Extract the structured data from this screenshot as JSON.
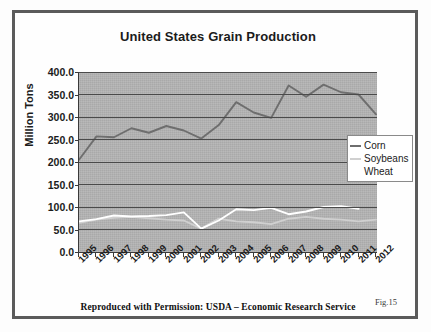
{
  "figure": {
    "title": "United States Grain Production",
    "credit": "Reproduced with Permission: USDA – Economic Research Service",
    "figure_number": "Fig.15"
  },
  "legend": {
    "position": "right-middle",
    "entries": [
      {
        "label": "Corn",
        "color": "#6e6e6e"
      },
      {
        "label": "Soybeans",
        "color": "#d0d0d0"
      },
      {
        "label": "Wheat",
        "color": "#ffffff"
      }
    ]
  },
  "axes": {
    "y_title": "Million Tons",
    "y_ticks": [
      "0.0",
      "50.0",
      "100.0",
      "150.0",
      "200.0",
      "250.0",
      "300.0",
      "350.0",
      "400.0"
    ],
    "x_ticks": [
      "1995",
      "1996",
      "1997",
      "1998",
      "1999",
      "2000",
      "2001",
      "2002",
      "2003",
      "2004",
      "2005",
      "2006",
      "2007",
      "2008",
      "2009",
      "2010",
      "2011",
      "2012"
    ]
  },
  "colors": {
    "plot_background": "#a9a9a9",
    "gridline": "#4a4a4a",
    "frame": "#5b5b5b",
    "text": "#1b1b1b"
  },
  "chart_data": {
    "type": "line",
    "title": "United States Grain Production",
    "xlabel": "",
    "ylabel": "Million Tons",
    "ylim": [
      0,
      400
    ],
    "ytick_step": 50,
    "grid": true,
    "legend_position": "right",
    "categories": [
      "1995",
      "1996",
      "1997",
      "1998",
      "1999",
      "2000",
      "2001",
      "2002",
      "2003",
      "2004",
      "2005",
      "2006",
      "2007",
      "2008",
      "2009",
      "2010",
      "2011",
      "2012"
    ],
    "series": [
      {
        "name": "Corn",
        "color": "#6e6e6e",
        "values": [
          205,
          257,
          255,
          275,
          265,
          280,
          270,
          252,
          282,
          333,
          310,
          298,
          370,
          345,
          372,
          355,
          350,
          306
        ]
      },
      {
        "name": "Soybeans",
        "color": "#d0d0d0",
        "values": [
          65,
          72,
          76,
          78,
          75,
          72,
          70,
          52,
          74,
          68,
          66,
          62,
          74,
          78,
          74,
          72,
          68,
          72
        ]
      },
      {
        "name": "Wheat",
        "color": "#ffffff",
        "values": [
          68,
          73,
          81,
          79,
          80,
          82,
          88,
          52,
          70,
          95,
          93,
          98,
          84,
          90,
          100,
          102,
          96,
          null
        ]
      }
    ]
  }
}
